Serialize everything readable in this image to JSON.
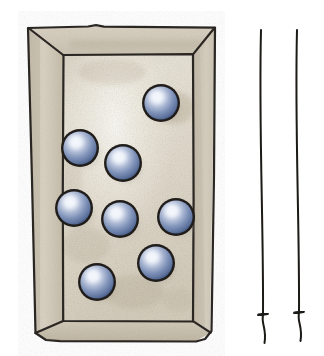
{
  "illustration": {
    "title": "Open box containing blue spheres with two hanging strings",
    "background_color": "#ffffff",
    "box": {
      "label": "open rectangular box seen in perspective",
      "rim_color": "#cfc7b8",
      "rim_shadow_color": "#b3a998",
      "interior_floor_color": "#e3ddd0",
      "interior_highlight_color": "#f4f1e8",
      "outline_color": "#2a2522",
      "outline_width": 2.2,
      "outer": {
        "top_left_x": 28,
        "top_right_x": 215,
        "top_y": 27,
        "bottom_left_x": 35,
        "bottom_right_x": 210,
        "bottom_y": 333
      },
      "inner": {
        "left_x": 63,
        "right_x": 193,
        "top_y": 55,
        "bottom_y": 321
      }
    },
    "spheres": {
      "label": "blue glass marbles",
      "count": 8,
      "radius": 19,
      "base_color": "#6a7fa8",
      "highlight_color": "#f2f5fb",
      "mid_color": "#8e9fc2",
      "edge_color": "#3f5378",
      "outline_color": "#1f1c1a",
      "shadow_color": "#9d9382",
      "items": [
        {
          "id": "sphere-1",
          "cx": 161,
          "cy": 103
        },
        {
          "id": "sphere-2",
          "cx": 80,
          "cy": 148
        },
        {
          "id": "sphere-3",
          "cx": 123,
          "cy": 163
        },
        {
          "id": "sphere-4",
          "cx": 74,
          "cy": 208
        },
        {
          "id": "sphere-5",
          "cx": 120,
          "cy": 219
        },
        {
          "id": "sphere-6",
          "cx": 176,
          "cy": 217
        },
        {
          "id": "sphere-7",
          "cx": 156,
          "cy": 263
        },
        {
          "id": "sphere-8",
          "cx": 97,
          "cy": 282
        }
      ]
    },
    "strings": {
      "label": "two thin vertical strings with knots near the lower end",
      "color": "#1d1a18",
      "stroke_width": 2.0,
      "items": [
        {
          "id": "string-left",
          "top_x": 261,
          "top_y": 30,
          "bottom_x": 263,
          "bottom_y": 343,
          "knot_y": 315,
          "knot_width": 9
        },
        {
          "id": "string-right",
          "top_x": 297,
          "top_y": 30,
          "bottom_x": 299,
          "bottom_y": 341,
          "knot_y": 313,
          "knot_width": 9
        }
      ]
    }
  }
}
